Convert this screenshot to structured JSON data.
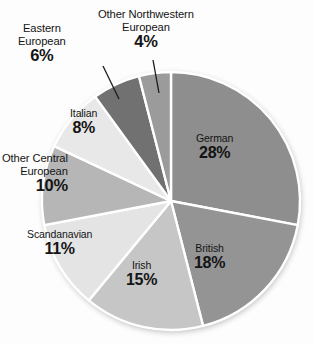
{
  "chart_data": {
    "type": "pie",
    "title": "",
    "subtitle": "",
    "xlabel": "",
    "ylabel": "",
    "legend_position": "none",
    "grid": false,
    "units": "percent",
    "start_angle_deg": 0,
    "direction": "clockwise",
    "categories": [
      "German",
      "British",
      "Irish",
      "Scandanavian",
      "Other Central European",
      "Italian",
      "Eastern European",
      "Other Northwestern European"
    ],
    "values": [
      28,
      18,
      15,
      11,
      10,
      8,
      6,
      4
    ],
    "labels": [
      "28%",
      "18%",
      "15%",
      "11%",
      "10%",
      "8%",
      "6%",
      "4%"
    ],
    "colors": [
      "#8e8e8e",
      "#949494",
      "#c6c6c6",
      "#e4e4e4",
      "#b6b6b6",
      "#e8e8e8",
      "#717171",
      "#9b9b9b"
    ],
    "slices": [
      {
        "name": "German",
        "value": 28,
        "label": "28%",
        "color": "#8e8e8e",
        "label_placement": "inside"
      },
      {
        "name": "British",
        "value": 18,
        "label": "18%",
        "color": "#949494",
        "label_placement": "inside"
      },
      {
        "name": "Irish",
        "value": 15,
        "label": "15%",
        "color": "#c6c6c6",
        "label_placement": "inside"
      },
      {
        "name": "Scandanavian",
        "value": 11,
        "label": "11%",
        "color": "#e4e4e4",
        "label_placement": "inside"
      },
      {
        "name": "Other Central European",
        "value": 10,
        "label": "10%",
        "color": "#b6b6b6",
        "label_placement": "inside"
      },
      {
        "name": "Italian",
        "value": 8,
        "label": "8%",
        "color": "#e8e8e8",
        "label_placement": "inside"
      },
      {
        "name": "Eastern European",
        "value": 6,
        "label": "6%",
        "color": "#717171",
        "label_placement": "outside-leader"
      },
      {
        "name": "Other Northwestern European",
        "value": 4,
        "label": "4%",
        "color": "#9b9b9b",
        "label_placement": "outside-leader"
      }
    ]
  },
  "labels": {
    "german": {
      "name": "German",
      "percent": "28%"
    },
    "british": {
      "name": "British",
      "percent": "18%"
    },
    "irish": {
      "name": "Irish",
      "percent": "15%"
    },
    "scandanavian": {
      "name": "Scandanavian",
      "percent": "11%"
    },
    "other_central": {
      "line1": "Other Central",
      "line2": "European",
      "percent": "10%"
    },
    "italian": {
      "name": "Italian",
      "percent": "8%"
    },
    "eastern": {
      "line1": "Eastern",
      "line2": "European",
      "percent": "6%"
    },
    "other_nw": {
      "line1": "Other Northwestern",
      "line2": "European",
      "percent": "4%"
    }
  },
  "style": {
    "separator_color": "#ffffff",
    "text_color": "#141414",
    "background": "#fdfdfd"
  }
}
